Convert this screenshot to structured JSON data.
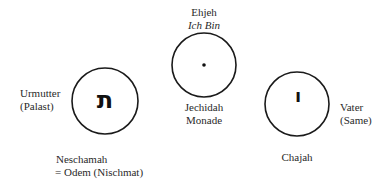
{
  "diagram": {
    "top_node": {
      "title": "Ehjeh",
      "subtitle": "Ich Bin",
      "symbol": "point",
      "caption_line1": "Jechidah",
      "caption_line2": "Monade"
    },
    "left_node": {
      "symbol": "ת",
      "side_label_line1": "Urmutter",
      "side_label_line2": "(Palast)",
      "caption_line1": "Neschamah",
      "caption_line2": "= Odem (Nischmat)"
    },
    "right_node": {
      "symbol": "ו",
      "side_label_line1": "Vater",
      "side_label_line2": "(Same)",
      "caption_line1": "Chajah"
    },
    "colors": {
      "stroke": "#1a1a1a",
      "text": "#2a2a2a"
    }
  }
}
